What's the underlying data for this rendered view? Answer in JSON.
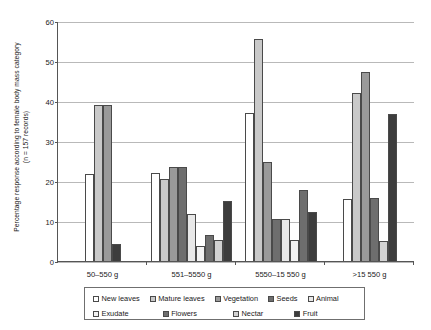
{
  "chart_data": {
    "type": "bar",
    "title": "",
    "xlabel": "",
    "ylabel": "Percentage response according to female body mass category",
    "ylabel_line2": "(n = 157 records)",
    "ylim": [
      0,
      60
    ],
    "yticks": [
      0,
      10,
      20,
      30,
      40,
      50,
      60
    ],
    "grid": true,
    "legend_position": "bottom",
    "categories": [
      "50–550 g",
      "551–5550 g",
      "5550–15 550 g",
      ">15 550 g"
    ],
    "series": [
      {
        "name": "New leaves",
        "color": "#ffffff",
        "values": [
          21.7,
          22.0,
          37.0,
          15.5
        ]
      },
      {
        "name": "Mature leaves",
        "color": "#c9c9c9",
        "values": [
          39.0,
          20.4,
          55.5,
          42.0
        ]
      },
      {
        "name": "Vegetation",
        "color": "#9a9a9a",
        "values": [
          39.0,
          23.5,
          24.8,
          47.3
        ]
      },
      {
        "name": "Seeds",
        "color": "#6e6e6e",
        "values": [
          null,
          23.5,
          10.5,
          15.8
        ]
      },
      {
        "name": "Animal",
        "color": "#e8e8e8",
        "values": [
          null,
          11.8,
          10.5,
          null
        ]
      },
      {
        "name": "Exudate",
        "color": "#f2f2f2",
        "values": [
          null,
          3.8,
          5.2,
          null
        ]
      },
      {
        "name": "Flowers",
        "color": "#6e6e6e",
        "values": [
          null,
          6.5,
          17.7,
          null
        ]
      },
      {
        "name": "Nectar",
        "color": "#d2d2d2",
        "values": [
          null,
          5.2,
          null,
          5.0
        ]
      },
      {
        "name": "Fruit",
        "color": "#3d3d3d",
        "values": [
          4.3,
          15.0,
          12.3,
          36.8
        ]
      }
    ]
  },
  "legend": {
    "row1": [
      "New leaves",
      "Mature leaves",
      "Vegetation",
      "Seeds",
      "Animal"
    ],
    "row2": [
      "Exudate",
      "Flowers",
      "Nectar",
      "Fruit"
    ]
  }
}
